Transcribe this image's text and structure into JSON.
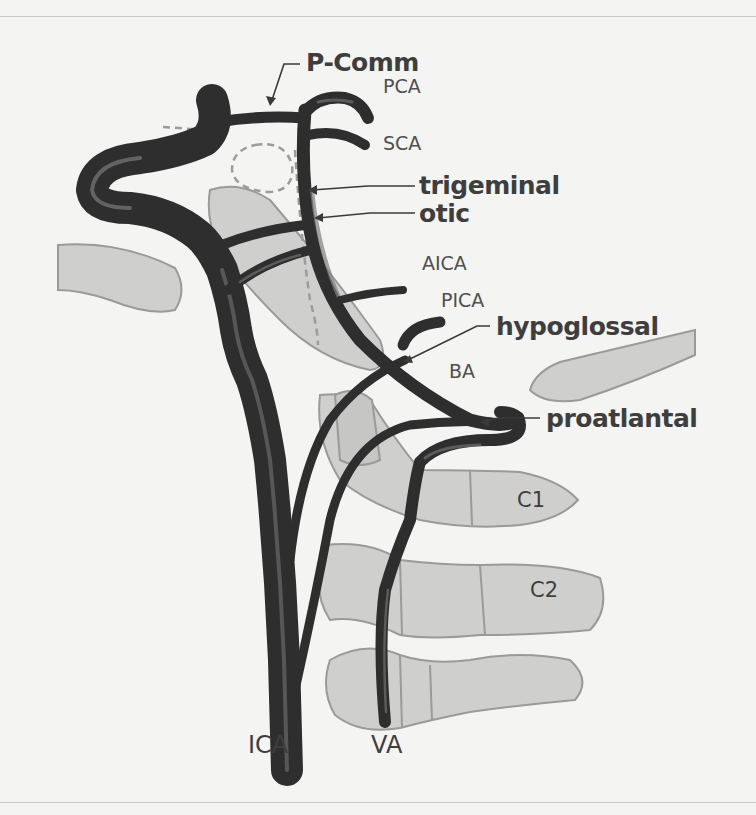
{
  "figure": {
    "colors": {
      "background": "#f4f4f2",
      "vessel": "#2e2e2e",
      "vessel_highlight": "#8a8a8a",
      "bone_fill": "#cfcfcd",
      "bone_stroke": "#9a9a98",
      "label_text": "#3e3e3e",
      "leader_line": "#3a3a3a",
      "dashed_outline": "#9c9c9c"
    }
  },
  "labels": {
    "p_comm": "P-Comm",
    "pca": "PCA",
    "sca": "SCA",
    "trigeminal": "trigeminal",
    "otic": "otic",
    "aica": "AICA",
    "pica": "PICA",
    "hypoglossal": "hypoglossal",
    "ba": "BA",
    "proatlantal": "proatlantal",
    "c1": "C1",
    "c2": "C2",
    "ica": "ICA",
    "va": "VA"
  }
}
